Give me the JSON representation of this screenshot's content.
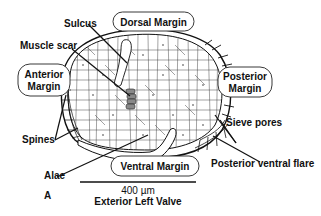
{
  "figure": {
    "panel_label": "A",
    "caption": "Exterior Left Valve",
    "scale_bar": {
      "value": "400 µm"
    }
  },
  "region_labels": {
    "dorsal": "Dorsal Margin",
    "anterior_line1": "Anterior",
    "anterior_line2": "Margin",
    "posterior_line1": "Posterior",
    "posterior_line2": "Margin",
    "ventral": "Ventral Margin"
  },
  "feature_labels": {
    "sulcus": "Sulcus",
    "muscle_scar": "Muscle scar",
    "spines": "Spines",
    "alae": "Alae",
    "sieve_pores": "Sieve pores",
    "posterior_ventral_flare": "Posterior ventral flare"
  },
  "colors": {
    "ink": "#111111",
    "muscle_scar_fill": "#888888",
    "background": "#ffffff"
  }
}
